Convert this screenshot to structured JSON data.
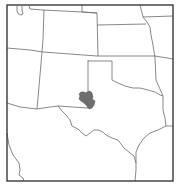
{
  "map": {
    "type": "range-map",
    "region": "Southwestern / South-Central United States",
    "states_depicted": [
      "Utah",
      "Colorado",
      "Wyoming",
      "Nebraska",
      "Kansas",
      "Arizona",
      "New Mexico",
      "Oklahoma",
      "Texas",
      "Missouri",
      "Arkansas",
      "Louisiana",
      "Iowa"
    ],
    "range_color": "#6e6e6e",
    "border_color": "#6a6a6a",
    "frame_color": "#2a2a2a",
    "background_color": "#ffffff",
    "highlighted_area": "Eastern New Mexico / western Texas Panhandle border region (Llano Estacado)"
  }
}
